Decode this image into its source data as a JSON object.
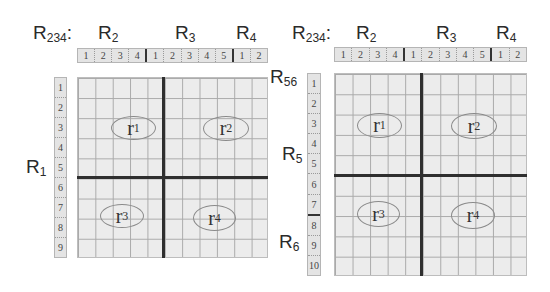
{
  "figures": [
    {
      "title_prefix": "R",
      "title_sub": "234",
      "title_suffix": ":",
      "column_groups": [
        {
          "label": "R",
          "sub": "2"
        },
        {
          "label": "R",
          "sub": "3"
        },
        {
          "label": "R",
          "sub": "4"
        }
      ],
      "column_headers": [
        "1",
        "2",
        "3",
        "4",
        "1",
        "2",
        "3",
        "4",
        "5",
        "1",
        "2"
      ],
      "row_headers": [
        "1",
        "2",
        "3",
        "4",
        "5",
        "6",
        "7",
        "8",
        "9"
      ],
      "row_groups": [
        {
          "label": "R",
          "sub": "1"
        }
      ],
      "regions": [
        {
          "label": "r",
          "sub": "1"
        },
        {
          "label": "r",
          "sub": "2"
        },
        {
          "label": "r",
          "sub": "3"
        },
        {
          "label": "r",
          "sub": "4"
        }
      ]
    },
    {
      "title_prefix": "R",
      "title_sub": "234",
      "title_suffix": ":",
      "column_groups": [
        {
          "label": "R",
          "sub": "2"
        },
        {
          "label": "R",
          "sub": "3"
        },
        {
          "label": "R",
          "sub": "4"
        }
      ],
      "column_headers": [
        "1",
        "2",
        "3",
        "4",
        "1",
        "2",
        "3",
        "4",
        "5",
        "1",
        "2"
      ],
      "row_headers": [
        "1",
        "2",
        "3",
        "4",
        "5",
        "6",
        "7",
        "8",
        "9",
        "10"
      ],
      "row_groups": [
        {
          "label": "R",
          "sub": "56"
        },
        {
          "label": "R",
          "sub": "5"
        },
        {
          "label": "R",
          "sub": "6"
        }
      ],
      "regions": [
        {
          "label": "r",
          "sub": "1"
        },
        {
          "label": "r",
          "sub": "2"
        },
        {
          "label": "r",
          "sub": "3"
        },
        {
          "label": "r",
          "sub": "4"
        }
      ]
    }
  ]
}
